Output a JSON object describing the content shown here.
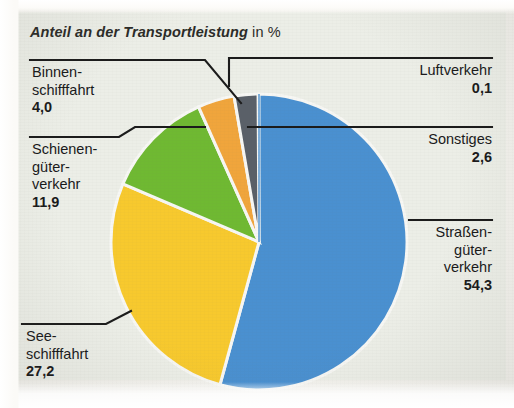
{
  "title": {
    "emphasis": "Anteil an der Transportleistung",
    "plain": " in %"
  },
  "chart_data": {
    "type": "pie",
    "title": "Anteil an der Transportleistung in %",
    "unit": "%",
    "xlabel": "",
    "ylabel": "",
    "legend_position": "callout-labels",
    "grid": false,
    "categories": [
      "Straßengüterverkehr",
      "Seeschifffahrt",
      "Schienengüterverkehr",
      "Binnenschifffahrt",
      "Sonstiges",
      "Luftverkehr"
    ],
    "values": [
      54.3,
      27.2,
      11.9,
      4.0,
      2.6,
      0.1
    ],
    "value_labels": [
      "54,3",
      "27,2",
      "11,9",
      "4,0",
      "2,6",
      "0,1"
    ],
    "colors": [
      "#4a90d0",
      "#f7c92e",
      "#6fb932",
      "#f0a53c",
      "#5a6068",
      "#4a90d0"
    ]
  },
  "labels": {
    "binnenschifffahrt": {
      "line1": "Binnen-",
      "line2": "schifffahrt",
      "value": "4,0"
    },
    "schienengueterverkehr": {
      "line1": "Schienen-",
      "line2": "güter-",
      "line3": "verkehr",
      "value": "11,9"
    },
    "seeschifffahrt": {
      "line1": "See-",
      "line2": "schifffahrt",
      "value": "27,2"
    },
    "luftverkehr": {
      "line1": "Luftverkehr",
      "value": "0,1"
    },
    "sonstiges": {
      "line1": "Sonstiges",
      "value": "2,6"
    },
    "strassengueterverkehr": {
      "line1": "Straßen-",
      "line2": "güter-",
      "line3": "verkehr",
      "value": "54,3"
    }
  },
  "colors": {
    "strassengueterverkehr": "#4a90d0",
    "seeschifffahrt": "#f7c92e",
    "schienengueterverkehr": "#6fb932",
    "binnenschifffahrt": "#f0a53c",
    "sonstiges": "#5a6068",
    "luftverkehr": "#4a90d0",
    "panel_background": "#eceee7",
    "text": "#19191a",
    "leader_line": "#1b1b1b"
  }
}
